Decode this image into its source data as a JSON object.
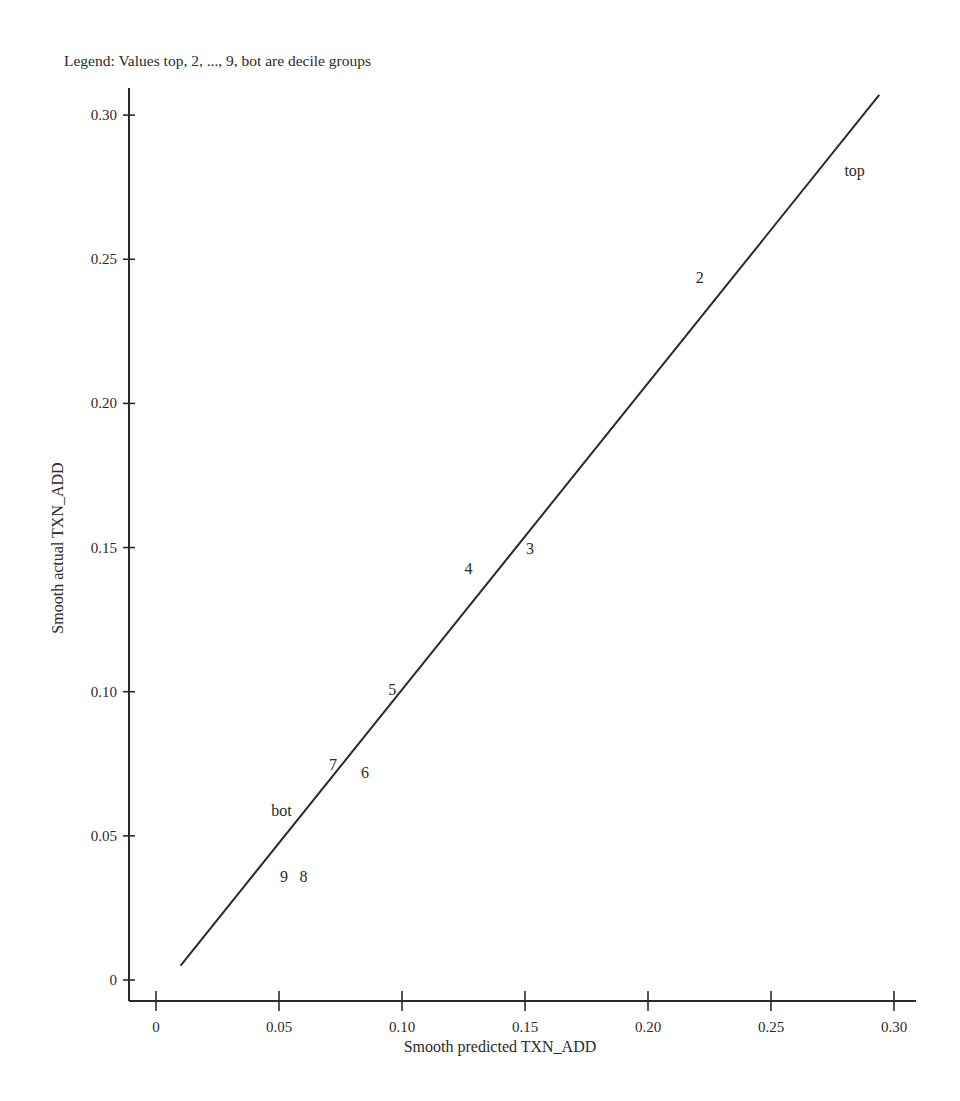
{
  "chart_data": {
    "type": "line",
    "title": "",
    "subtitle": "Legend: Values top, 2, ..., 9, bot are decile groups",
    "xlabel": "Smooth predicted TXN_ADD",
    "ylabel": "Smooth actual TXN_ADD",
    "xlim": [
      -0.011,
      0.309
    ],
    "ylim": [
      -0.007,
      0.313
    ],
    "x_ticks": [
      0,
      0.05,
      0.1,
      0.15,
      0.2,
      0.25,
      0.3
    ],
    "x_tick_labels": [
      "0",
      "0.05",
      "0.10",
      "0.15",
      "0.20",
      "0.25",
      "0.30"
    ],
    "y_ticks": [
      0,
      0.05,
      0.1,
      0.15,
      0.2,
      0.25,
      0.3
    ],
    "y_tick_labels": [
      "0",
      "0.05",
      "0.10",
      "0.15",
      "0.20",
      "0.25",
      "0.30"
    ],
    "grid": false,
    "legend_position": "top-left text note",
    "series": [
      {
        "name": "smooth fit line",
        "type": "line",
        "x": [
          0.01,
          0.294
        ],
        "y": [
          0.005,
          0.307
        ]
      },
      {
        "name": "decile groups",
        "type": "scatter-labels",
        "points": [
          {
            "label": "top",
            "x": 0.284,
            "y": 0.281
          },
          {
            "label": "2",
            "x": 0.221,
            "y": 0.244
          },
          {
            "label": "3",
            "x": 0.152,
            "y": 0.15
          },
          {
            "label": "4",
            "x": 0.127,
            "y": 0.143
          },
          {
            "label": "5",
            "x": 0.096,
            "y": 0.101
          },
          {
            "label": "6",
            "x": 0.085,
            "y": 0.072
          },
          {
            "label": "7",
            "x": 0.072,
            "y": 0.075
          },
          {
            "label": "8",
            "x": 0.06,
            "y": 0.036
          },
          {
            "label": "9",
            "x": 0.052,
            "y": 0.036
          },
          {
            "label": "bot",
            "x": 0.051,
            "y": 0.059
          }
        ]
      }
    ]
  },
  "colors": {
    "ink": "#2a2a2a",
    "background": "#ffffff"
  }
}
